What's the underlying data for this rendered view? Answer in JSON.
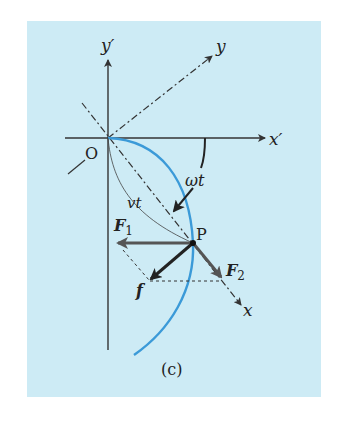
{
  "figure": {
    "panel_label": "(c)",
    "background_color": "#cdebf5",
    "curve_color": "#3b9ad8",
    "axis_color": "#333333",
    "force_color": "#555555",
    "resultant_color": "#222222"
  },
  "axes": {
    "x_prime": "x′",
    "y_prime": "y′",
    "x_rot": "x",
    "y_rot": "y",
    "origin": "O"
  },
  "labels": {
    "angle": "ωt",
    "arc": "vt",
    "point": "P",
    "force1_main": "F",
    "force1_sub": "1",
    "force2_main": "F",
    "force2_sub": "2",
    "resultant": "f"
  }
}
